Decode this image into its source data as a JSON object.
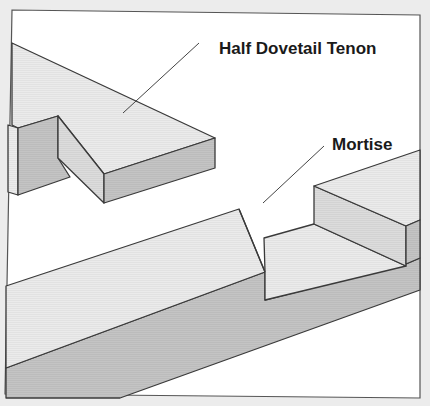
{
  "diagram": {
    "labels": {
      "tenon": "Half Dovetail Tenon",
      "mortise": "Mortise"
    },
    "colors": {
      "background": "#ececec",
      "frame_fill": "#ffffff",
      "top_face": "#ececec",
      "side_face": "#c2c2c2",
      "inner_face": "#dadada",
      "outline": "#3a3a3a"
    },
    "parts": [
      {
        "name": "Half Dovetail Tenon",
        "role": "tenon"
      },
      {
        "name": "Mortise",
        "role": "mortise"
      }
    ]
  }
}
